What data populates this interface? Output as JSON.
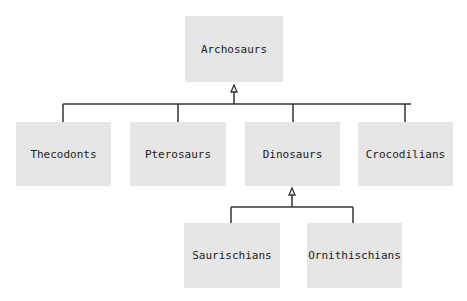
{
  "diagram": {
    "type": "hierarchy",
    "root": {
      "label": "Archosaurs"
    },
    "level1": [
      {
        "label": "Thecodonts"
      },
      {
        "label": "Pterosaurs"
      },
      {
        "label": "Dinosaurs"
      },
      {
        "label": "Crocodilians"
      }
    ],
    "level2": [
      {
        "label": "Saurischians",
        "parent": "Dinosaurs"
      },
      {
        "label": "Ornithischians",
        "parent": "Dinosaurs"
      }
    ],
    "colors": {
      "box": "#e6e6e6",
      "line": "#333333",
      "text": "#222222"
    }
  }
}
